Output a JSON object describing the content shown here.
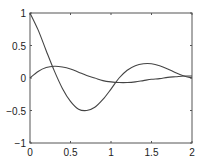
{
  "chart_data": {
    "type": "line",
    "title": "",
    "xlabel": "",
    "ylabel": "",
    "xlim": [
      0,
      2
    ],
    "ylim": [
      -1,
      1
    ],
    "grid": false,
    "legend": null,
    "x_ticks": [
      "0",
      "0.5",
      "1",
      "1.5",
      "2"
    ],
    "y_ticks": [
      "1",
      "0.5",
      "0",
      "-0.5",
      "-1"
    ],
    "x": [
      0,
      0.1,
      0.2,
      0.3,
      0.4,
      0.5,
      0.6,
      0.7,
      0.8,
      0.9,
      1.0,
      1.1,
      1.2,
      1.3,
      1.4,
      1.5,
      1.6,
      1.7,
      1.8,
      1.9,
      2.0
    ],
    "series": [
      {
        "name": "curve-1",
        "values": [
          1.0,
          0.74,
          0.42,
          0.11,
          -0.16,
          -0.36,
          -0.48,
          -0.5,
          -0.45,
          -0.33,
          -0.17,
          0.0,
          0.12,
          0.19,
          0.22,
          0.22,
          0.19,
          0.14,
          0.08,
          0.03,
          0.0
        ]
      },
      {
        "name": "curve-2",
        "values": [
          0.0,
          0.1,
          0.16,
          0.18,
          0.17,
          0.14,
          0.09,
          0.04,
          0.0,
          -0.04,
          -0.06,
          -0.07,
          -0.07,
          -0.06,
          -0.04,
          -0.02,
          -0.01,
          0.01,
          0.02,
          0.03,
          0.03
        ]
      }
    ]
  }
}
